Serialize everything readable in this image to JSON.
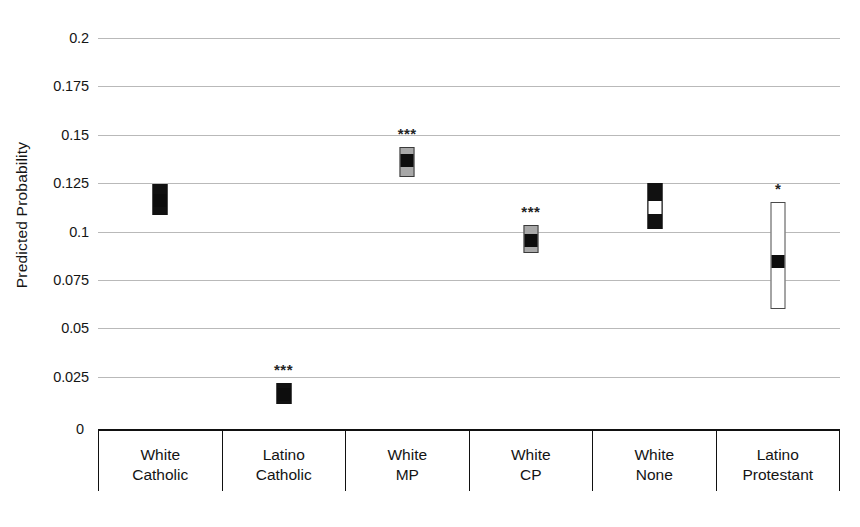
{
  "chart_data": {
    "type": "bar",
    "title": "",
    "xlabel": "",
    "ylabel": "Predicted Probability",
    "ylim": [
      0,
      0.2
    ],
    "ytick_labels": [
      "0.2",
      "0.175",
      "0.15",
      "0.125",
      "0.1",
      "0.075",
      "0.05",
      "0.025",
      "0"
    ],
    "ytick_values": [
      0.2,
      0.175,
      0.15,
      0.125,
      0.1,
      0.075,
      0.05,
      0.025,
      0
    ],
    "grid": true,
    "legend": "none",
    "categories": [
      [
        "White",
        "Catholic"
      ],
      [
        "Latino",
        "Catholic"
      ],
      [
        "White",
        "MP"
      ],
      [
        "White",
        "CP"
      ],
      [
        "White",
        "None"
      ],
      [
        "Latino",
        "Protestant"
      ]
    ],
    "category_labels": [
      "White Catholic",
      "Latino Catholic",
      "White MP",
      "White CP",
      "White None",
      "Latino Protestant"
    ],
    "values": [
      0.116,
      0.016,
      0.1365,
      0.0955,
      0.1125,
      0.0845
    ],
    "ci_low": [
      0.1085,
      0.011,
      0.128,
      0.089,
      0.1015,
      0.06
    ],
    "ci_high": [
      0.1245,
      0.0215,
      0.1435,
      0.1035,
      0.125,
      0.115
    ],
    "significance": [
      "",
      "***",
      "***",
      "***",
      "",
      "*"
    ],
    "series": [
      {
        "name": "Predicted Probability",
        "points": [
          {
            "category": "White Catholic",
            "estimate": 0.116,
            "ci_low": 0.1085,
            "ci_high": 0.1245,
            "significance": "",
            "bar_style": "dark",
            "marker_style": "black"
          },
          {
            "category": "Latino Catholic",
            "estimate": 0.016,
            "ci_low": 0.011,
            "ci_high": 0.0215,
            "significance": "***",
            "bar_style": "dark",
            "marker_style": "black"
          },
          {
            "category": "White MP",
            "estimate": 0.1365,
            "ci_low": 0.128,
            "ci_high": 0.1435,
            "significance": "***",
            "bar_style": "gray",
            "marker_style": "black"
          },
          {
            "category": "White CP",
            "estimate": 0.0955,
            "ci_low": 0.089,
            "ci_high": 0.1035,
            "significance": "***",
            "bar_style": "gray",
            "marker_style": "black"
          },
          {
            "category": "White None",
            "estimate": 0.1125,
            "ci_low": 0.1015,
            "ci_high": 0.125,
            "significance": "",
            "bar_style": "dark",
            "marker_style": "white"
          },
          {
            "category": "Latino Protestant",
            "estimate": 0.0845,
            "ci_low": 0.06,
            "ci_high": 0.115,
            "significance": "*",
            "bar_style": "open",
            "marker_style": "black"
          }
        ]
      }
    ]
  },
  "colors": {
    "gridline": "#b9b9b9",
    "axis": "#111111",
    "bar_dark": "#111111",
    "bar_gray": "#a8a8a8",
    "bar_open": "#ffffff",
    "point_black": "#0d0d0d",
    "point_white": "#ffffff",
    "text": "#141414"
  }
}
